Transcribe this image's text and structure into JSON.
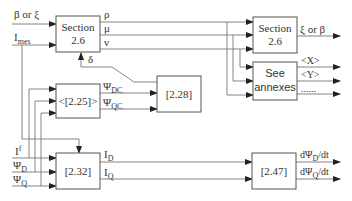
{
  "diagram": {
    "blocks": {
      "section_left": {
        "line1": "Section",
        "line2": "2.6"
      },
      "section_right": {
        "line1": "Section",
        "line2": "2.6"
      },
      "annexes": {
        "line1": "See",
        "line2": "annexes"
      },
      "eq_2_25": {
        "label": "<[2.25]>"
      },
      "eq_2_28": {
        "label": "[2.28]"
      },
      "eq_2_32": {
        "label": "[2.32]"
      },
      "eq_2_47": {
        "label": "[2.47]"
      }
    },
    "inputs": {
      "beta_or_xi": "β or ξ",
      "i_mes": {
        "main": "I",
        "sub": "mes"
      },
      "i_f": {
        "main": "I",
        "sup": "f"
      },
      "psi_d": {
        "main": "Ψ",
        "sub": "D"
      },
      "psi_q": {
        "main": "Ψ",
        "sub": "Q"
      }
    },
    "signals": {
      "rho": "ρ",
      "mu": "μ",
      "nu": "ν",
      "delta": "δ",
      "psi_dc": {
        "main": "Ψ",
        "sub": "DC"
      },
      "psi_qc": {
        "main": "Ψ",
        "sub": "QC"
      },
      "i_d": {
        "main": "I",
        "sub": "D"
      },
      "i_q": {
        "main": "I",
        "sub": "Q"
      }
    },
    "outputs": {
      "xi_or_beta": "ξ or β",
      "x": "<X>",
      "y": "<Y>",
      "more": "......",
      "dpsi_d_dt": {
        "pre": "dΨ",
        "sub": "D",
        "post": "/dt"
      },
      "dpsi_q_dt": {
        "pre": "dΨ",
        "sub": "Q",
        "post": "/dt"
      }
    }
  }
}
